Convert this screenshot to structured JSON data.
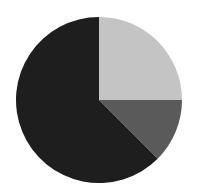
{
  "chart_data": {
    "type": "pie",
    "title": "",
    "categories": [
      "Slice A",
      "Slice B",
      "Slice C"
    ],
    "values": [
      25,
      12.5,
      62.5
    ],
    "colors": [
      "#c4c4c4",
      "#5a5a5a",
      "#1e1e1e"
    ],
    "start_angle_deg": 0,
    "direction": "clockwise",
    "legend": null,
    "labels_visible": false
  },
  "layout": {
    "cx": 99,
    "cy": 100,
    "r": 83,
    "background": "#ffffff"
  }
}
